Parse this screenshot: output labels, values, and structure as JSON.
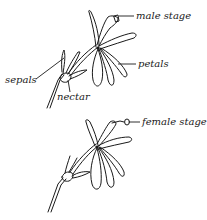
{
  "figure": {
    "type": "botanical-diagram",
    "panels": [
      {
        "id": "male",
        "labels": {
          "stage": "male stage",
          "sepals": "sepals",
          "nectar": "nectar",
          "petals": "petals"
        }
      },
      {
        "id": "female",
        "labels": {
          "stage": "female stage"
        }
      }
    ],
    "ink_color": "#1a1a1a",
    "background": "#ffffff"
  }
}
